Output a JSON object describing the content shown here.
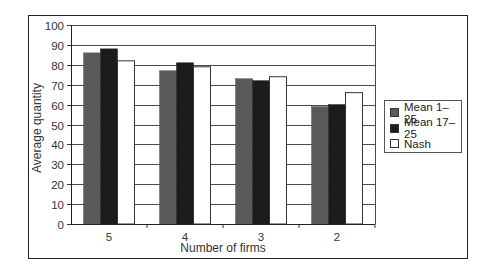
{
  "chart_data": {
    "type": "bar",
    "title": "",
    "xlabel": "Number of firms",
    "ylabel": "Average quantity",
    "categories": [
      "5",
      "4",
      "3",
      "2"
    ],
    "series": [
      {
        "name": "Mean 1–25",
        "color": "#5a5a5a",
        "values": [
          86,
          77,
          73,
          59
        ]
      },
      {
        "name": "Mean 17–25",
        "color": "#1c1c1c",
        "values": [
          88,
          81,
          72,
          60
        ]
      },
      {
        "name": "Nash",
        "color": "#ffffff",
        "values": [
          82,
          79,
          74,
          66
        ]
      }
    ],
    "ylim": [
      0,
      100
    ],
    "yticks": [
      0,
      10,
      20,
      30,
      40,
      50,
      60,
      70,
      80,
      90,
      100
    ],
    "grid": true,
    "legend_position": "right"
  },
  "legend": {
    "items": [
      {
        "label": "Mean 1–25"
      },
      {
        "label": "Mean 17–25"
      },
      {
        "label": "Nash"
      }
    ]
  },
  "axes": {
    "xlabel": "Number of firms",
    "ylabel": "Average quantity"
  }
}
